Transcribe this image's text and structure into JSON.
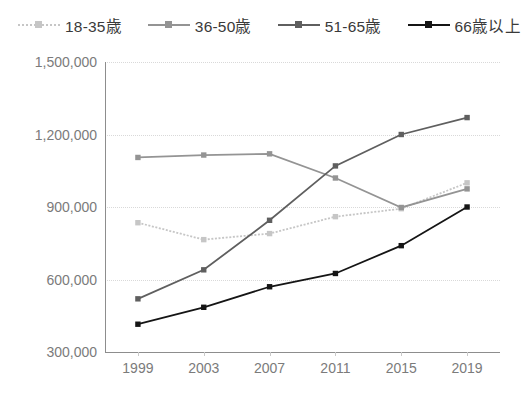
{
  "chart_data": {
    "type": "line",
    "title": "",
    "xlabel": "",
    "ylabel": "",
    "categories": [
      "1999",
      "2003",
      "2007",
      "2011",
      "2015",
      "2019"
    ],
    "x": [
      1999,
      2003,
      2007,
      2011,
      2015,
      2019
    ],
    "ylim": [
      300000,
      1500000
    ],
    "yticks": [
      300000,
      600000,
      900000,
      1200000,
      1500000
    ],
    "ytick_labels": [
      "300,000",
      "600,000",
      "900,000",
      "1,200,000",
      "1,500,000"
    ],
    "grid": true,
    "legend_position": "top",
    "series": [
      {
        "name": "18-35歳",
        "color": "#c6c6c6",
        "line_style": "dotted",
        "marker": "square",
        "values": [
          835000,
          765000,
          790000,
          860000,
          893000,
          1000000
        ]
      },
      {
        "name": "36-50歳",
        "color": "#949494",
        "line_style": "solid",
        "marker": "square",
        "values": [
          1105000,
          1115000,
          1120000,
          1020000,
          898000,
          975000
        ]
      },
      {
        "name": "51-65歳",
        "color": "#5f5f5f",
        "line_style": "solid",
        "marker": "square",
        "values": [
          520000,
          640000,
          845000,
          1070000,
          1200000,
          1270000
        ]
      },
      {
        "name": "66歳以上",
        "color": "#151515",
        "line_style": "solid",
        "marker": "square",
        "values": [
          415000,
          485000,
          570000,
          625000,
          740000,
          900000
        ]
      }
    ]
  },
  "legend": {
    "items": [
      {
        "label": "18-35歳"
      },
      {
        "label": "36-50歳"
      },
      {
        "label": "51-65歳"
      },
      {
        "label": "66歳以上"
      }
    ]
  },
  "axes": {
    "y_tick_labels": [
      "1,500,000",
      "1,200,000",
      "900,000",
      "600,000",
      "300,000"
    ],
    "x_tick_labels": [
      "1999",
      "2003",
      "2007",
      "2011",
      "2015",
      "2019"
    ]
  },
  "colors": {
    "series_18_35": "#c6c6c6",
    "series_36_50": "#949494",
    "series_51_65": "#5f5f5f",
    "series_66_plus": "#151515",
    "axis": "#8d8d8d",
    "grid": "#d9d9d9",
    "tick_text": "#7b7b7b",
    "legend_text": "#3a3a3a",
    "background": "#ffffff"
  }
}
